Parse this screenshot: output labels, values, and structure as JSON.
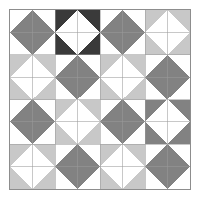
{
  "artwork": {
    "title": "Quilt Pattern",
    "type": "quilt-diagram",
    "grid_columns": 8,
    "grid_rows": 8,
    "block_columns": 4,
    "block_rows": 4,
    "background_color": "#ffffff",
    "grid_line_color": "#9a9a9a",
    "border_color": "#8d8d8d",
    "palette": {
      "white": "#ffffff",
      "light_gray": "#c8c8c8",
      "medium_gray": "#828282",
      "dark_charcoal": "#3a3a3a"
    },
    "palette_names": [
      "white",
      "light_gray",
      "medium_gray",
      "dark_charcoal"
    ],
    "blocks": [
      {
        "row": 0,
        "col": 0,
        "motif": "diamond",
        "ground": "white",
        "diamond": "medium_gray"
      },
      {
        "row": 0,
        "col": 1,
        "motif": "diamond",
        "ground": "dark_charcoal",
        "diamond": "white"
      },
      {
        "row": 0,
        "col": 2,
        "motif": "diamond",
        "ground": "white",
        "diamond": "medium_gray"
      },
      {
        "row": 0,
        "col": 3,
        "motif": "diamond",
        "ground": "light_gray",
        "diamond": "white"
      },
      {
        "row": 1,
        "col": 0,
        "motif": "diamond",
        "ground": "light_gray",
        "diamond": "white"
      },
      {
        "row": 1,
        "col": 1,
        "motif": "diamond",
        "ground": "white",
        "diamond": "medium_gray"
      },
      {
        "row": 1,
        "col": 2,
        "motif": "diamond",
        "ground": "light_gray",
        "diamond": "white"
      },
      {
        "row": 1,
        "col": 3,
        "motif": "diamond",
        "ground": "white",
        "diamond": "medium_gray"
      },
      {
        "row": 2,
        "col": 0,
        "motif": "diamond",
        "ground": "white",
        "diamond": "medium_gray"
      },
      {
        "row": 2,
        "col": 1,
        "motif": "diamond",
        "ground": "light_gray",
        "diamond": "white"
      },
      {
        "row": 2,
        "col": 2,
        "motif": "diamond",
        "ground": "white",
        "diamond": "medium_gray"
      },
      {
        "row": 2,
        "col": 3,
        "motif": "diamond",
        "ground": "medium_gray",
        "diamond": "white"
      },
      {
        "row": 3,
        "col": 0,
        "motif": "diamond",
        "ground": "light_gray",
        "diamond": "white"
      },
      {
        "row": 3,
        "col": 1,
        "motif": "diamond",
        "ground": "white",
        "diamond": "medium_gray"
      },
      {
        "row": 3,
        "col": 2,
        "motif": "diamond",
        "ground": "light_gray",
        "diamond": "white"
      },
      {
        "row": 3,
        "col": 3,
        "motif": "diamond",
        "ground": "white",
        "diamond": "medium_gray"
      }
    ]
  }
}
